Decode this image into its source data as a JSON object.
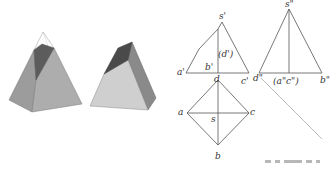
{
  "figure": {
    "colors": {
      "line": "#555555",
      "light_face": "#c8c8c8",
      "mid_face": "#a9a9a9",
      "dark_face": "#5a5a5a",
      "left_face": "#9c9c9c"
    }
  },
  "front_view": {
    "labels": {
      "s": "s'",
      "d_hidden": "(d')",
      "b": "b'",
      "a": "a'",
      "c": "c'"
    }
  },
  "side_view": {
    "labels": {
      "s": "s\"",
      "d": "d\"",
      "ac_hidden": "(a\"c\")",
      "b": "b\""
    }
  },
  "top_view": {
    "labels": {
      "d": "d",
      "a": "a",
      "s": "s",
      "c": "c",
      "b": "b"
    }
  }
}
